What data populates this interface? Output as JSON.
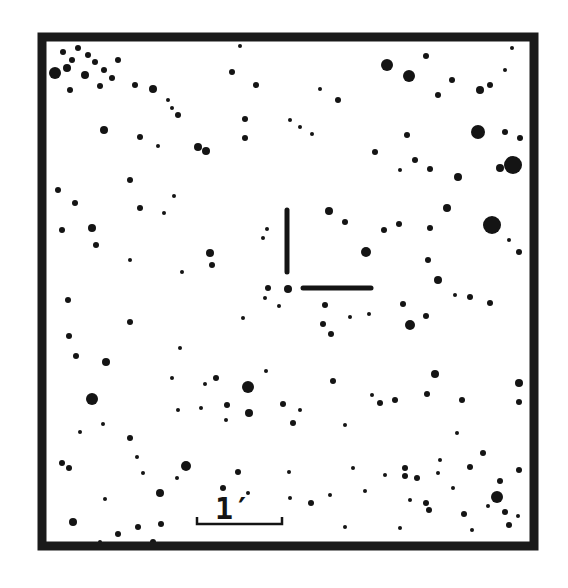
{
  "chart": {
    "type": "finding-chart",
    "frame": {
      "x": 42,
      "y": 37,
      "width": 492,
      "height": 509,
      "border": 9,
      "color": "#1a1a1a"
    },
    "background": "#ffffff",
    "star_color": "#141414",
    "marker": {
      "vertical": {
        "x": 287,
        "y1": 210,
        "y2": 272,
        "width": 5
      },
      "horizontal": {
        "x1": 303,
        "x2": 371,
        "y": 288,
        "width": 5
      }
    },
    "scale_bar": {
      "label": "1′",
      "x1": 197,
      "x2": 282,
      "y": 524,
      "tick": 7,
      "label_x": 233,
      "label_y": 519
    }
  },
  "stars": [
    [
      55,
      73,
      6
    ],
    [
      67,
      68,
      4
    ],
    [
      72,
      60,
      3
    ],
    [
      63,
      52,
      3
    ],
    [
      78,
      48,
      3
    ],
    [
      88,
      55,
      3
    ],
    [
      95,
      62,
      3
    ],
    [
      104,
      70,
      3
    ],
    [
      112,
      78,
      3
    ],
    [
      85,
      75,
      4
    ],
    [
      70,
      90,
      3
    ],
    [
      100,
      86,
      3
    ],
    [
      118,
      60,
      3
    ],
    [
      135,
      85,
      3
    ],
    [
      153,
      89,
      4
    ],
    [
      168,
      100,
      2
    ],
    [
      172,
      108,
      2
    ],
    [
      178,
      115,
      3
    ],
    [
      198,
      147,
      4
    ],
    [
      206,
      151,
      4
    ],
    [
      104,
      130,
      4
    ],
    [
      140,
      137,
      3
    ],
    [
      158,
      146,
      2
    ],
    [
      58,
      190,
      3
    ],
    [
      62,
      230,
      3
    ],
    [
      92,
      228,
      4
    ],
    [
      96,
      245,
      3
    ],
    [
      75,
      203,
      3
    ],
    [
      130,
      180,
      3
    ],
    [
      174,
      196,
      2
    ],
    [
      245,
      138,
      3
    ],
    [
      245,
      119,
      3
    ],
    [
      232,
      72,
      3
    ],
    [
      240,
      46,
      2
    ],
    [
      387,
      65,
      6
    ],
    [
      409,
      76,
      6
    ],
    [
      426,
      56,
      3
    ],
    [
      452,
      80,
      3
    ],
    [
      438,
      95,
      3
    ],
    [
      480,
      90,
      4
    ],
    [
      490,
      85,
      3
    ],
    [
      505,
      70,
      2
    ],
    [
      512,
      48,
      2
    ],
    [
      478,
      132,
      7
    ],
    [
      513,
      165,
      9
    ],
    [
      492,
      225,
      9
    ],
    [
      447,
      208,
      4
    ],
    [
      458,
      177,
      4
    ],
    [
      500,
      168,
      4
    ],
    [
      520,
      138,
      3
    ],
    [
      505,
      132,
      3
    ],
    [
      430,
      169,
      3
    ],
    [
      415,
      160,
      3
    ],
    [
      407,
      135,
      3
    ],
    [
      400,
      170,
      2
    ],
    [
      375,
      152,
      3
    ],
    [
      312,
      134,
      2
    ],
    [
      300,
      127,
      2
    ],
    [
      290,
      120,
      2
    ],
    [
      338,
      100,
      3
    ],
    [
      320,
      89,
      2
    ],
    [
      256,
      85,
      3
    ],
    [
      329,
      211,
      4
    ],
    [
      345,
      222,
      3
    ],
    [
      366,
      252,
      5
    ],
    [
      384,
      230,
      3
    ],
    [
      399,
      224,
      3
    ],
    [
      430,
      228,
      3
    ],
    [
      428,
      260,
      3
    ],
    [
      438,
      280,
      4
    ],
    [
      470,
      297,
      3
    ],
    [
      490,
      303,
      3
    ],
    [
      519,
      252,
      3
    ],
    [
      509,
      240,
      2
    ],
    [
      263,
      238,
      2
    ],
    [
      267,
      229,
      2
    ],
    [
      268,
      288,
      3
    ],
    [
      288,
      289,
      4
    ],
    [
      265,
      298,
      2
    ],
    [
      279,
      306,
      2
    ],
    [
      210,
      253,
      4
    ],
    [
      212,
      265,
      3
    ],
    [
      182,
      272,
      2
    ],
    [
      140,
      208,
      3
    ],
    [
      164,
      213,
      2
    ],
    [
      130,
      260,
      2
    ],
    [
      69,
      336,
      3
    ],
    [
      68,
      300,
      3
    ],
    [
      76,
      356,
      3
    ],
    [
      106,
      362,
      4
    ],
    [
      130,
      322,
      3
    ],
    [
      92,
      399,
      6
    ],
    [
      80,
      432,
      2
    ],
    [
      180,
      348,
      2
    ],
    [
      205,
      384,
      2
    ],
    [
      248,
      387,
      6
    ],
    [
      249,
      413,
      4
    ],
    [
      227,
      405,
      3
    ],
    [
      216,
      378,
      3
    ],
    [
      201,
      408,
      2
    ],
    [
      178,
      410,
      2
    ],
    [
      172,
      378,
      2
    ],
    [
      266,
      371,
      2
    ],
    [
      283,
      404,
      3
    ],
    [
      323,
      324,
      3
    ],
    [
      325,
      305,
      3
    ],
    [
      331,
      334,
      3
    ],
    [
      350,
      317,
      2
    ],
    [
      369,
      314,
      2
    ],
    [
      410,
      325,
      5
    ],
    [
      403,
      304,
      3
    ],
    [
      426,
      316,
      3
    ],
    [
      455,
      295,
      2
    ],
    [
      333,
      381,
      3
    ],
    [
      380,
      403,
      3
    ],
    [
      395,
      400,
      3
    ],
    [
      435,
      374,
      4
    ],
    [
      462,
      400,
      3
    ],
    [
      519,
      383,
      4
    ],
    [
      519,
      402,
      3
    ],
    [
      427,
      394,
      3
    ],
    [
      293,
      423,
      3
    ],
    [
      300,
      410,
      2
    ],
    [
      345,
      425,
      2
    ],
    [
      372,
      395,
      2
    ],
    [
      353,
      468,
      2
    ],
    [
      385,
      475,
      2
    ],
    [
      405,
      468,
      3
    ],
    [
      405,
      476,
      3
    ],
    [
      417,
      478,
      3
    ],
    [
      470,
      467,
      3
    ],
    [
      497,
      497,
      6
    ],
    [
      488,
      506,
      2
    ],
    [
      505,
      512,
      3
    ],
    [
      519,
      470,
      3
    ],
    [
      500,
      481,
      3
    ],
    [
      483,
      453,
      3
    ],
    [
      440,
      460,
      2
    ],
    [
      457,
      433,
      2
    ],
    [
      69,
      468,
      3
    ],
    [
      62,
      463,
      3
    ],
    [
      73,
      522,
      4
    ],
    [
      105,
      499,
      2
    ],
    [
      100,
      542,
      2
    ],
    [
      153,
      542,
      3
    ],
    [
      118,
      534,
      3
    ],
    [
      138,
      527,
      3
    ],
    [
      161,
      524,
      3
    ],
    [
      177,
      478,
      2
    ],
    [
      186,
      466,
      5
    ],
    [
      223,
      488,
      3
    ],
    [
      238,
      472,
      3
    ],
    [
      248,
      493,
      2
    ],
    [
      289,
      472,
      2
    ],
    [
      290,
      498,
      2
    ],
    [
      311,
      503,
      3
    ],
    [
      330,
      495,
      2
    ],
    [
      345,
      527,
      2
    ],
    [
      365,
      491,
      2
    ],
    [
      410,
      500,
      2
    ],
    [
      426,
      503,
      3
    ],
    [
      429,
      510,
      3
    ],
    [
      438,
      473,
      2
    ],
    [
      464,
      514,
      3
    ],
    [
      509,
      525,
      3
    ],
    [
      518,
      516,
      2
    ],
    [
      472,
      530,
      2
    ],
    [
      453,
      488,
      2
    ],
    [
      400,
      528,
      2
    ],
    [
      143,
      473,
      2
    ],
    [
      160,
      493,
      4
    ],
    [
      103,
      424,
      2
    ],
    [
      130,
      438,
      3
    ],
    [
      226,
      420,
      2
    ],
    [
      137,
      457,
      2
    ],
    [
      243,
      318,
      2
    ]
  ]
}
